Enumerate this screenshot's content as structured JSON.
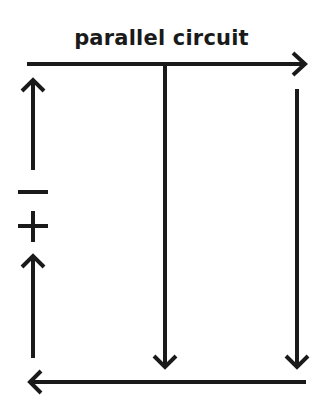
{
  "diagram": {
    "title": "parallel circuit",
    "battery": {
      "negative_symbol": "−",
      "positive_symbol": "+"
    },
    "stroke_color": "#1a1a1a",
    "current_direction": [
      "top wire: left to right",
      "branch 1: downward",
      "branch 2: downward",
      "bottom wire: right to left",
      "battery side: upward"
    ]
  }
}
